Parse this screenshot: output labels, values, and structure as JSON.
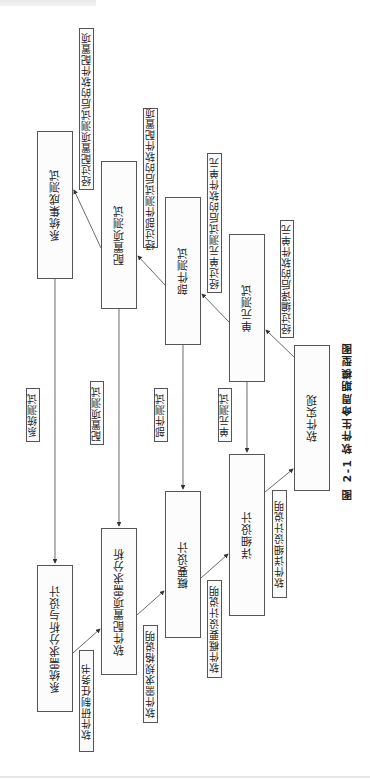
{
  "figure": {
    "caption_number": "图 2-1",
    "caption_title": "软件生命周期模型图",
    "caption": "图 2-1   软件生命周期模型图"
  },
  "boxes": {
    "system_integration_test": "系统集成测试",
    "config_item_test": "配置项测试",
    "component_test": "部件测试",
    "unit_test": "单元测试",
    "software_implementation": "软件实现",
    "detailed_design": "详细设计",
    "preliminary_design": "概要设计",
    "software_config_item_requirements": "软件配置项需求分析",
    "system_requirements_design": "系统需求分析与设计"
  },
  "labels": {
    "after_config_item_test": "经过配置项测试后的软件配置项",
    "after_component_test": "经过部件测试后的软件配置项",
    "after_unit_test": "经过单元测试后的软件单元",
    "after_compile": "经过编译后的软件单元",
    "system_test": "系统测试",
    "config_item_test": "配置项测试",
    "component_test": "部件测试",
    "unit_test": "单元测试",
    "dev_task_book": "软件研制任务书",
    "requirements_spec": "软件需求规格说明",
    "preliminary_design_doc": "软件概要设计说明",
    "detailed_design_doc": "软件详细设计说明"
  }
}
